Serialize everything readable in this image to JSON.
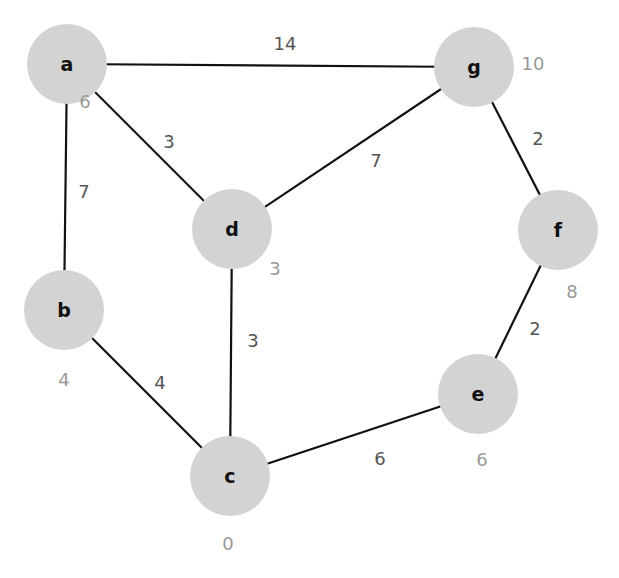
{
  "graph": {
    "colors": {
      "node_fill": "#d3d3d3",
      "edge": "#111111",
      "weight_text": "#555555",
      "distance_text": "#999999"
    },
    "nodes": [
      {
        "id": "a",
        "label": "a",
        "x": 67,
        "y": 64,
        "r": 40,
        "distance": "6",
        "dx": 85,
        "dy": 108
      },
      {
        "id": "g",
        "label": "g",
        "x": 474,
        "y": 67,
        "r": 40,
        "distance": "10",
        "dx": 533,
        "dy": 70
      },
      {
        "id": "d",
        "label": "d",
        "x": 232,
        "y": 229,
        "r": 40,
        "distance": "3",
        "dx": 275,
        "dy": 275
      },
      {
        "id": "f",
        "label": "f",
        "x": 558,
        "y": 230,
        "r": 40,
        "distance": "8",
        "dx": 572,
        "dy": 298
      },
      {
        "id": "b",
        "label": "b",
        "x": 64,
        "y": 310,
        "r": 40,
        "distance": "4",
        "dx": 64,
        "dy": 386
      },
      {
        "id": "e",
        "label": "e",
        "x": 478,
        "y": 394,
        "r": 40,
        "distance": "6",
        "dx": 482,
        "dy": 466
      },
      {
        "id": "c",
        "label": "c",
        "x": 230,
        "y": 476,
        "r": 40,
        "distance": "0",
        "dx": 228,
        "dy": 550
      }
    ],
    "edges": [
      {
        "from": "a",
        "to": "g",
        "weight": "14",
        "lx": 285,
        "ly": 50
      },
      {
        "from": "a",
        "to": "d",
        "weight": "3",
        "lx": 169,
        "ly": 148
      },
      {
        "from": "a",
        "to": "b",
        "weight": "7",
        "lx": 84,
        "ly": 198
      },
      {
        "from": "g",
        "to": "d",
        "weight": "7",
        "lx": 376,
        "ly": 167
      },
      {
        "from": "g",
        "to": "f",
        "weight": "2",
        "lx": 538,
        "ly": 145
      },
      {
        "from": "d",
        "to": "c",
        "weight": "3",
        "lx": 253,
        "ly": 347
      },
      {
        "from": "b",
        "to": "c",
        "weight": "4",
        "lx": 160,
        "ly": 389
      },
      {
        "from": "f",
        "to": "e",
        "weight": "2",
        "lx": 535,
        "ly": 335
      },
      {
        "from": "c",
        "to": "e",
        "weight": "6",
        "lx": 380,
        "ly": 465
      }
    ]
  }
}
